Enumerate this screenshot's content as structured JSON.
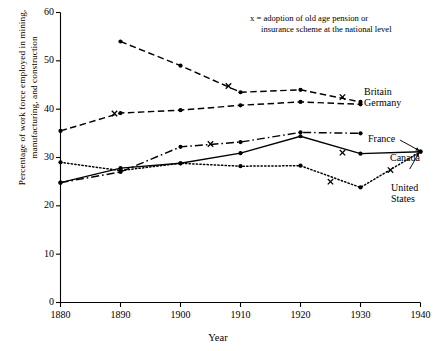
{
  "figure": {
    "note": {
      "line1": "x  =  adoption of old age pension or",
      "line2": "insurance scheme at the national level"
    },
    "ylabel_line1": "Percentage of work force employed in mining,",
    "ylabel_line2": "manufacturing, and construction",
    "xlabel": "Year",
    "series_labels": {
      "britain": "Britain",
      "germany": "Germany",
      "france": "France",
      "canada": "Canada",
      "united_states_l1": "United",
      "united_states_l2": "States"
    },
    "colors": {
      "ink": "#000000",
      "background": "#ffffff"
    }
  },
  "chart_data": {
    "type": "line",
    "title": "",
    "xlabel": "Year",
    "ylabel": "Percentage of work force employed in mining, manufacturing, and construction",
    "xlim": [
      1880,
      1940
    ],
    "ylim": [
      0,
      60
    ],
    "xticks": [
      1880,
      1890,
      1900,
      1910,
      1920,
      1930,
      1940
    ],
    "yticks": [
      0,
      10,
      20,
      30,
      40,
      50,
      60
    ],
    "grid": false,
    "legend_position": "inline-right-end-labels",
    "annotations": [
      "x  =  adoption of old age pension or insurance scheme at the national level"
    ],
    "series": [
      {
        "name": "Britain",
        "line_style": "dashed",
        "marker": "filled-circle",
        "x": [
          1890,
          1900,
          1910,
          1920,
          1930
        ],
        "values": [
          54.0,
          49.0,
          43.5,
          44.0,
          41.5
        ],
        "pension_marker_x": [
          1908,
          1927
        ],
        "pension_marker_values": [
          44.8,
          42.5
        ]
      },
      {
        "name": "Germany",
        "line_style": "dashed",
        "marker": "filled-circle",
        "x": [
          1880,
          1890,
          1900,
          1910,
          1920,
          1930
        ],
        "values": [
          35.5,
          39.2,
          39.8,
          40.8,
          41.5,
          41.0
        ],
        "pension_marker_x": [
          1889
        ],
        "pension_marker_values": [
          39.1
        ]
      },
      {
        "name": "France",
        "line_style": "dash-dot",
        "marker": "filled-circle",
        "x": [
          1880,
          1890,
          1900,
          1910,
          1920,
          1930
        ],
        "values": [
          24.8,
          27.0,
          32.2,
          33.2,
          35.2,
          35.0
        ],
        "pension_marker_x": [
          1905
        ],
        "pension_marker_values": [
          32.8
        ]
      },
      {
        "name": "Canada",
        "line_style": "solid",
        "marker": "filled-circle",
        "x": [
          1880,
          1890,
          1900,
          1910,
          1920,
          1930,
          1940
        ],
        "values": [
          24.8,
          27.8,
          28.8,
          30.9,
          34.4,
          30.8,
          31.2
        ],
        "pension_marker_x": [
          1927
        ],
        "pension_marker_values": [
          31.0
        ]
      },
      {
        "name": "United States",
        "line_style": "dotted",
        "marker": "filled-circle",
        "x": [
          1880,
          1890,
          1900,
          1910,
          1920,
          1930,
          1940
        ],
        "values": [
          29.0,
          27.3,
          28.8,
          28.2,
          28.3,
          23.8,
          31.2
        ],
        "pension_marker_x": [
          1925,
          1935
        ],
        "pension_marker_values": [
          25.0,
          27.4
        ]
      }
    ]
  }
}
